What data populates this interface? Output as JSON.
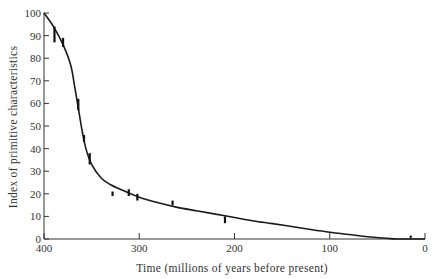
{
  "chart_data": {
    "type": "line",
    "title": "",
    "xlabel": "Time (millions of years before present)",
    "ylabel": "Index of primitive characteristics",
    "xlim": [
      400,
      0
    ],
    "ylim": [
      0,
      100
    ],
    "x_ticks": [
      400,
      300,
      200,
      100,
      0
    ],
    "y_ticks": [
      0,
      10,
      20,
      30,
      40,
      50,
      60,
      70,
      80,
      90,
      100
    ],
    "grid": false,
    "legend": null,
    "series": [
      {
        "name": "fitted curve",
        "kind": "line",
        "x": [
          400,
          390,
          380,
          372,
          368,
          364,
          360,
          356,
          350,
          340,
          330,
          320,
          300,
          280,
          260,
          240,
          220,
          200,
          180,
          160,
          140,
          120,
          100,
          80,
          60,
          40,
          30,
          20,
          10,
          0
        ],
        "y": [
          100,
          94,
          86,
          77,
          68,
          58,
          48,
          40,
          33,
          27,
          24,
          22,
          18.5,
          16,
          14,
          12.5,
          11,
          9.5,
          8,
          6.8,
          5.5,
          4.2,
          3,
          2,
          1,
          0.3,
          0,
          0,
          0,
          0
        ]
      },
      {
        "name": "observations",
        "kind": "marker",
        "x": [
          389,
          380,
          364,
          358,
          352,
          328,
          311,
          302,
          265,
          210,
          15
        ],
        "y": [
          91,
          87,
          60,
          45,
          36,
          20,
          21,
          19,
          16,
          9,
          1
        ],
        "y_low": [
          87,
          85,
          57,
          43,
          33,
          19,
          19,
          17,
          15,
          7,
          0.5
        ],
        "y_high": [
          94,
          89,
          62,
          46,
          38,
          21,
          22,
          20,
          17,
          10,
          1.5
        ]
      }
    ]
  }
}
